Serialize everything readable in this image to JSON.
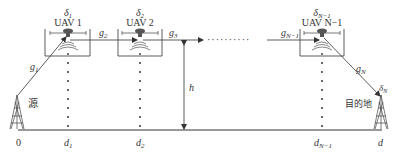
{
  "diagram": {
    "type": "multi-hop UAV relay network",
    "colors": {
      "line": "#333333",
      "background": "#ffffff",
      "uav_body": "#555555"
    },
    "uavs": [
      {
        "id": "uav1",
        "label": "UAV 1",
        "delta": "δ",
        "delta_sub": "1",
        "position_label": "d",
        "position_sub": "1"
      },
      {
        "id": "uav2",
        "label": "UAV 2",
        "delta": "δ",
        "delta_sub": "2",
        "position_label": "d",
        "position_sub": "2"
      },
      {
        "id": "uavN1",
        "label": "UAV N−1",
        "delta": "δ",
        "delta_sub": "N−1",
        "position_label": "d",
        "position_sub": "N−1"
      }
    ],
    "links": {
      "g1": {
        "base": "g",
        "sub": "1"
      },
      "g2": {
        "base": "g",
        "sub": "2"
      },
      "g3": {
        "base": "g",
        "sub": "3"
      },
      "gN1": {
        "base": "g",
        "sub": "N−1"
      },
      "gN": {
        "base": "g",
        "sub": "N"
      }
    },
    "height_label": "h",
    "source": {
      "label": "源",
      "position": "0"
    },
    "destination": {
      "label": "目的地",
      "position": "d",
      "delta": "δ",
      "delta_sub": "N"
    },
    "ellipsis": "··········"
  }
}
